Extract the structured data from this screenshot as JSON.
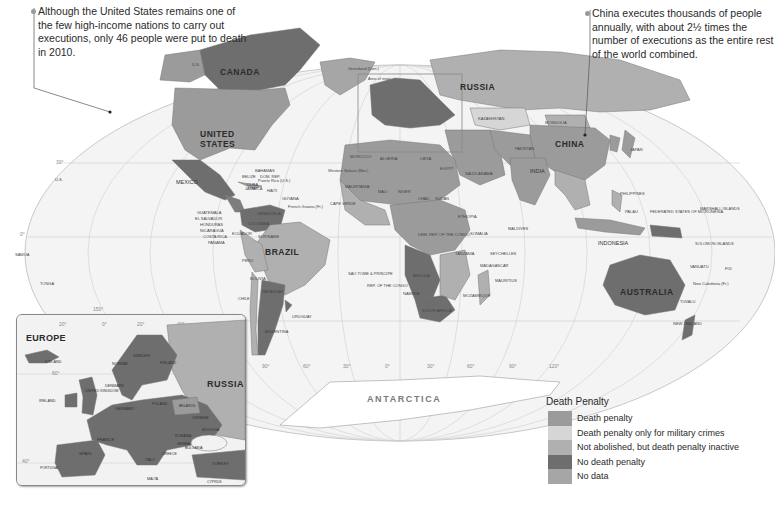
{
  "callouts": {
    "us": "Although the United States remains one of the few high-income nations to carry out executions, only 46 people were put to death in 2010.",
    "china": "China executes thousands of people annually, with about 2½ times the number of executions as the entire rest of the world combined."
  },
  "map": {
    "inset_marker_label": "Area of inset",
    "antarctica": "ANTARCTICA",
    "country_labels": {
      "canada": "CANADA",
      "us": "UNITED STATES",
      "us_alaska": "U.S.",
      "us_hawaii": "U.S.",
      "greenland": "Greenland (Den.)",
      "mexico": "MEXICO",
      "brazil": "BRAZIL",
      "russia": "RUSSIA",
      "china": "CHINA",
      "india": "INDIA",
      "australia": "AUSTRALIA",
      "indonesia": "INDONESIA",
      "kazakhstan": "KAZAKHSTAN",
      "mongolia": "MONGOLIA",
      "algeria": "ALGERIA",
      "libya": "LIBYA",
      "egypt": "EGYPT",
      "sudan": "SUDAN",
      "mali": "MALI",
      "niger": "NIGER",
      "chad": "CHAD",
      "ethiopia": "ETHIOPIA",
      "angola": "ANGOLA",
      "namibia": "NAMIBIA",
      "south_africa": "SOUTH AFRICA",
      "madagascar": "MADAGASCAR",
      "mozambique": "MOZAMBIQUE",
      "saudi_arabia": "SAUDI ARABIA",
      "iran": "IRAN",
      "argentina": "ARGENTINA",
      "peru": "PERU",
      "bolivia": "BOLIVIA",
      "chile": "CHILE",
      "colombia": "COLOMBIA",
      "venezuela": "VENEZUELA",
      "paraguay": "PARAGUAY",
      "uruguay": "URUGUAY",
      "morocco": "MOROCCO",
      "mauritania": "MAURITANIA",
      "japan": "JAPAN",
      "north_korea": "NORTH KOREA",
      "south_korea": "SOUTH KOREA",
      "philippines": "PHILIPPINES",
      "new_zealand": "NEW ZEALAND",
      "pakistan": "PAKISTAN",
      "afghanistan": "AFGHANISTAN",
      "tanzania": "TANZANIA",
      "somalia": "SOMALIA",
      "kenya": "KENYA",
      "yemen": "YEMEN",
      "oman": "OMAN",
      "iraq": "IRAQ",
      "thailand": "THAILAND",
      "vietnam": "VIETNAM",
      "myanmar": "MYANMAR",
      "ecuador": "ECUADOR",
      "suriname": "SURINAME",
      "guyana": "GUYANA",
      "french_guiana": "French Guiana (Fr.)",
      "samoa": "SAMOA",
      "tonga": "TONGA",
      "fiji": "FIJI",
      "vanuatu": "VANUATU",
      "new_caledonia": "New Caledonia (Fr.)",
      "solomon_islands": "SOLOMON ISLANDS",
      "micronesia": "FEDERATED STATES OF MICRONESIA",
      "marshall_islands": "MARSHALL ISLANDS",
      "palau": "PALAU",
      "nauru": "NAURU",
      "kiribati": "KIRIBATI",
      "tuvalu": "TUVALU",
      "timor_leste": "TIMOR-LESTE",
      "papua_new_guinea": "PAPUA NEW GUINEA",
      "maldives": "MALDIVES",
      "sri_lanka": "SRI LANKA",
      "comoros": "COMOROS",
      "seychelles": "SEYCHELLES",
      "mauritius": "MAURITIUS",
      "swaziland": "SWAZILAND",
      "lesotho": "LESOTHO",
      "cape_verde": "CAPE VERDE",
      "western_sahara": "Western Sahara (Mor.)",
      "rep_congo": "REP. OF THE CONGO",
      "dem_rep_congo": "DEM. REP. OF THE CONGO",
      "sao_tome": "SAO TOME & PRINCIPE",
      "cote_divoire": "CÔTE D'IVOIRE",
      "eq_guinea": "EQ. GUINEA",
      "guatemala": "GUATEMALA",
      "el_salvador": "EL SALVADOR",
      "honduras": "HONDURAS",
      "nicaragua": "NICARAGUA",
      "costa_rica": "COSTA RICA",
      "panama": "PANAMA",
      "belize": "BELIZE",
      "cuba": "CUBA",
      "jamaica": "JAMAICA",
      "haiti": "HAITI",
      "bahamas": "BAHAMAS",
      "dom_rep": "DOM. REP.",
      "puerto_rico": "Puerto Rico (U.S.)",
      "grenada": "GRENADA",
      "singapore": "Singapore",
      "hong_kong": "Hong Kong",
      "macau": "Macau",
      "taiwan": "Taiwan",
      "brunei": "BRUNEI",
      "malaysia": "MALAYSIA",
      "cambodia": "CAMBODIA",
      "bangladesh": "BANGLADESH"
    },
    "graticule_labels": {
      "lat": [
        "30°",
        "0°",
        "30°",
        "30°"
      ],
      "lon": [
        "150°",
        "30°",
        "60°",
        "30°",
        "0°",
        "30°",
        "60°",
        "90°",
        "120°"
      ]
    }
  },
  "inset": {
    "title": "EUROPE",
    "graticule_labels": [
      "20°",
      "0°",
      "20°",
      "40°",
      "60°",
      "40°"
    ],
    "labels": {
      "russia": "RUSSIA",
      "iceland": "ICELAND",
      "norway": "NORWAY",
      "sweden": "SWEDEN",
      "finland": "FINLAND",
      "ireland": "IRELAND",
      "uk": "UNITED KINGDOM",
      "denmark": "DENMARK",
      "germany": "GERMANY",
      "poland": "POLAND",
      "belarus": "BELARUS",
      "ukraine": "UKRAINE",
      "moldova": "MOLDOVA",
      "romania": "ROMANIA",
      "france": "FRANCE",
      "spain": "SPAIN",
      "portugal": "PORTUGAL",
      "italy": "ITALY",
      "switz": "SWITZ.",
      "czech": "CZECH REP.",
      "aus": "AUS.",
      "hung": "HUNG.",
      "serbia": "SERBIA",
      "bulgaria": "BULGARIA",
      "turkey": "TURKEY",
      "greece": "GREECE",
      "mac": "MAC.",
      "lux": "LUX.",
      "neth": "NETH.",
      "lithuania": "LITHUANIA",
      "latvia": "LATVIA",
      "estonia": "ESTONIA",
      "malta": "MALTA",
      "cyprus": "CYPRUS",
      "slvk": "SLVK."
    }
  },
  "legend": {
    "title": "Death Penalty",
    "items": [
      {
        "label": "Death penalty",
        "color": "#9b9b9b"
      },
      {
        "label": "Death penalty only for military crimes",
        "color": "#d6d6d6"
      },
      {
        "label": "Not abolished, but death penalty inactive",
        "color": "#b0b0b0"
      },
      {
        "label": "No death penalty",
        "color": "#6e6e6e"
      },
      {
        "label": "No data",
        "color": "#a6a6a6"
      }
    ]
  },
  "colors": {
    "death_penalty": "#9b9b9b",
    "military_only": "#d6d6d6",
    "inactive": "#b0b0b0",
    "no_death_penalty": "#6e6e6e",
    "no_data": "#a6a6a6",
    "ocean": "#f4f4f4"
  }
}
